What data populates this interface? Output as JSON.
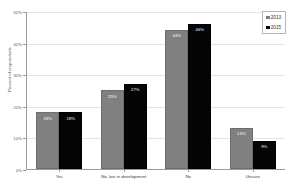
{
  "chart_data": {
    "type": "bar",
    "title": "",
    "xlabel": "",
    "ylabel": "Percent of respondents",
    "ylim": [
      0,
      50
    ],
    "grid": true,
    "legend_position": "top-right",
    "categories": [
      "Yes",
      "No, but in development",
      "No",
      "Unsure"
    ],
    "ytick_labels": [
      "0%",
      "10%",
      "20%",
      "30%",
      "40%",
      "50%"
    ],
    "ytick_values": [
      0,
      10,
      20,
      30,
      40,
      50
    ],
    "series": [
      {
        "name": "2013",
        "color": "#808080",
        "values": [
          18,
          25,
          44,
          13
        ],
        "labels": [
          "18%",
          "25%",
          "44%",
          "13%"
        ]
      },
      {
        "name": "2015",
        "color": "#050505",
        "values": [
          18,
          27,
          46,
          9
        ],
        "labels": [
          "18%",
          "27%",
          "46%",
          "9%"
        ]
      }
    ]
  },
  "legend": {
    "items": [
      {
        "label": "2013",
        "color": "#808080"
      },
      {
        "label": "2015",
        "color": "#050505"
      }
    ]
  },
  "title_remnant": ""
}
